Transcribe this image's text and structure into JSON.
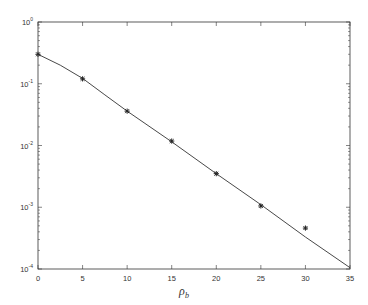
{
  "chart_data": {
    "type": "line",
    "title": "",
    "xlabel": "ρ_b",
    "xlabel_main": "ρ",
    "xlabel_sub": "b",
    "ylabel": "",
    "yscale": "log",
    "xlim": [
      0,
      35
    ],
    "ylim": [
      0.0001,
      1
    ],
    "grid": false,
    "legend": null,
    "x_ticks": [
      0,
      5,
      10,
      15,
      20,
      25,
      30,
      35
    ],
    "x_tick_labels": [
      "0",
      "5",
      "10",
      "15",
      "20",
      "25",
      "30",
      "35"
    ],
    "y_ticks": [
      1,
      0.1,
      0.01,
      0.001,
      0.0001
    ],
    "y_tick_labels": [
      {
        "base": "10",
        "exp": "0"
      },
      {
        "base": "10",
        "exp": "-1"
      },
      {
        "base": "10",
        "exp": "-2"
      },
      {
        "base": "10",
        "exp": "-3"
      },
      {
        "base": "10",
        "exp": "-4"
      }
    ],
    "series": [
      {
        "name": "theory curve",
        "style": "solid line",
        "x": [
          0,
          2.5,
          5,
          7.5,
          10,
          15,
          20,
          25,
          30,
          35
        ],
        "values": [
          0.3,
          0.2,
          0.122,
          0.066,
          0.036,
          0.0115,
          0.0035,
          0.0011,
          0.00033,
          0.000105
        ]
      },
      {
        "name": "simulation points",
        "style": "asterisk markers",
        "x": [
          0,
          5,
          10,
          15,
          20,
          25,
          30
        ],
        "values": [
          0.3,
          0.12,
          0.036,
          0.0118,
          0.0035,
          0.00105,
          0.00046
        ]
      }
    ]
  },
  "colors": {
    "axis": "#333333",
    "line": "#333333",
    "marker": "#222222",
    "background": "#ffffff"
  }
}
